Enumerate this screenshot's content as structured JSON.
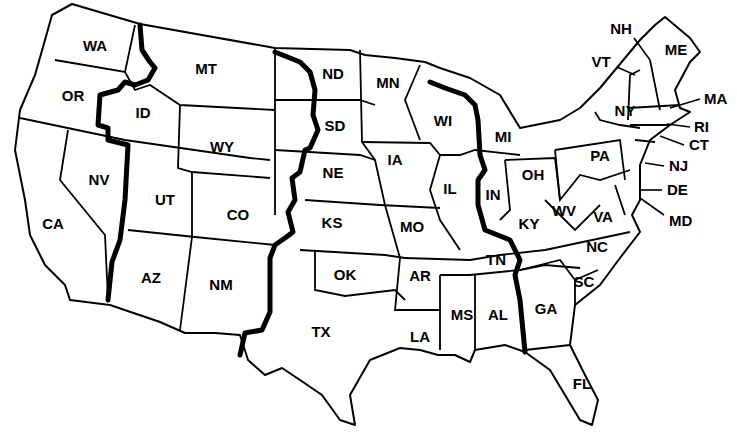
{
  "map": {
    "type": "US states with time zone boundaries",
    "background_color": "#ffffff",
    "line_color": "#000000",
    "states": [
      {
        "id": "WA",
        "label": "WA",
        "x": 95,
        "y": 51
      },
      {
        "id": "OR",
        "label": "OR",
        "x": 73,
        "y": 101
      },
      {
        "id": "CA",
        "label": "CA",
        "x": 53,
        "y": 229
      },
      {
        "id": "ID",
        "label": "ID",
        "x": 143,
        "y": 118
      },
      {
        "id": "NV",
        "label": "NV",
        "x": 99,
        "y": 185
      },
      {
        "id": "MT",
        "label": "MT",
        "x": 206,
        "y": 74
      },
      {
        "id": "WY",
        "label": "WY",
        "x": 222,
        "y": 152
      },
      {
        "id": "UT",
        "label": "UT",
        "x": 165,
        "y": 205
      },
      {
        "id": "CO",
        "label": "CO",
        "x": 238,
        "y": 220
      },
      {
        "id": "AZ",
        "label": "AZ",
        "x": 151,
        "y": 283
      },
      {
        "id": "NM",
        "label": "NM",
        "x": 221,
        "y": 290
      },
      {
        "id": "ND",
        "label": "ND",
        "x": 333,
        "y": 79
      },
      {
        "id": "SD",
        "label": "SD",
        "x": 335,
        "y": 131
      },
      {
        "id": "NE",
        "label": "NE",
        "x": 333,
        "y": 178
      },
      {
        "id": "KS",
        "label": "KS",
        "x": 332,
        "y": 228
      },
      {
        "id": "OK",
        "label": "OK",
        "x": 345,
        "y": 280
      },
      {
        "id": "TX",
        "label": "TX",
        "x": 321,
        "y": 337
      },
      {
        "id": "MN",
        "label": "MN",
        "x": 388,
        "y": 88
      },
      {
        "id": "IA",
        "label": "IA",
        "x": 395,
        "y": 165
      },
      {
        "id": "MO",
        "label": "MO",
        "x": 412,
        "y": 232
      },
      {
        "id": "AR",
        "label": "AR",
        "x": 420,
        "y": 281
      },
      {
        "id": "LA",
        "label": "LA",
        "x": 420,
        "y": 342
      },
      {
        "id": "WI",
        "label": "WI",
        "x": 443,
        "y": 126
      },
      {
        "id": "IL",
        "label": "IL",
        "x": 450,
        "y": 194
      },
      {
        "id": "MI",
        "label": "MI",
        "x": 503,
        "y": 142
      },
      {
        "id": "IN",
        "label": "IN",
        "x": 493,
        "y": 200
      },
      {
        "id": "OH",
        "label": "OH",
        "x": 533,
        "y": 180
      },
      {
        "id": "KY",
        "label": "KY",
        "x": 529,
        "y": 229
      },
      {
        "id": "TN",
        "label": "TN",
        "x": 496,
        "y": 265
      },
      {
        "id": "MS",
        "label": "MS",
        "x": 462,
        "y": 320
      },
      {
        "id": "AL",
        "label": "AL",
        "x": 498,
        "y": 320
      },
      {
        "id": "GA",
        "label": "GA",
        "x": 546,
        "y": 314
      },
      {
        "id": "FL",
        "label": "FL",
        "x": 582,
        "y": 389
      },
      {
        "id": "SC",
        "label": "SC",
        "x": 584,
        "y": 287
      },
      {
        "id": "NC",
        "label": "NC",
        "x": 597,
        "y": 252
      },
      {
        "id": "VA",
        "label": "VA",
        "x": 603,
        "y": 222
      },
      {
        "id": "WV",
        "label": "WV",
        "x": 564,
        "y": 216
      },
      {
        "id": "PA",
        "label": "PA",
        "x": 600,
        "y": 161
      },
      {
        "id": "NY",
        "label": "NY",
        "x": 625,
        "y": 116
      },
      {
        "id": "VT",
        "label": "VT",
        "x": 601,
        "y": 67
      },
      {
        "id": "NH",
        "label": "NH",
        "x": 621,
        "y": 34
      },
      {
        "id": "ME",
        "label": "ME",
        "x": 676,
        "y": 55
      },
      {
        "id": "MA",
        "label": "MA",
        "x": 704,
        "y": 99
      },
      {
        "id": "RI",
        "label": "RI",
        "x": 694,
        "y": 127
      },
      {
        "id": "CT",
        "label": "CT",
        "x": 689,
        "y": 145
      },
      {
        "id": "NJ",
        "label": "NJ",
        "x": 669,
        "y": 166
      },
      {
        "id": "DE",
        "label": "DE",
        "x": 667,
        "y": 190
      },
      {
        "id": "MD",
        "label": "MD",
        "x": 669,
        "y": 221
      }
    ],
    "time_zone_boundaries": [
      "Pacific-Mountain",
      "Mountain-Central",
      "Central-Eastern"
    ]
  }
}
